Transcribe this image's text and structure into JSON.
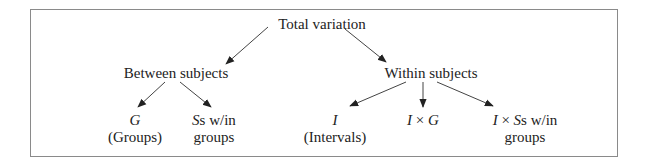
{
  "diagram": {
    "root": {
      "label": "Total variation"
    },
    "between": {
      "label": "Between subjects",
      "children": [
        {
          "symbol": "G",
          "line2": "(Groups)"
        },
        {
          "symbol": "S",
          "rest": "s w/in",
          "line2": "groups"
        }
      ]
    },
    "within": {
      "label": "Within subjects",
      "children": [
        {
          "symbol": "I",
          "line2": "(Intervals)"
        },
        {
          "sym_a": "I",
          "times": " × ",
          "sym_b": "G"
        },
        {
          "sym_a": "I",
          "times": " × ",
          "sym_b": "S",
          "rest": "s w/in",
          "line2": "groups"
        }
      ]
    },
    "colors": {
      "border": "#8a8a8a",
      "arrow": "#333333",
      "text": "#222222"
    }
  }
}
